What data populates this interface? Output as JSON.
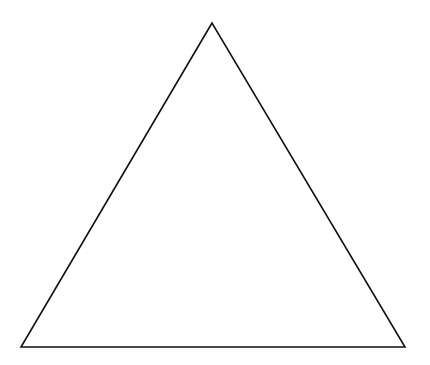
{
  "diagram": {
    "shape": "triangle",
    "style": "outline",
    "stroke_color": "#111111",
    "fill_color": "#ffffff",
    "vertices": {
      "apex": [
        212,
        23
      ],
      "bottom_left": [
        21,
        347
      ],
      "bottom_right": [
        405,
        347
      ]
    }
  }
}
